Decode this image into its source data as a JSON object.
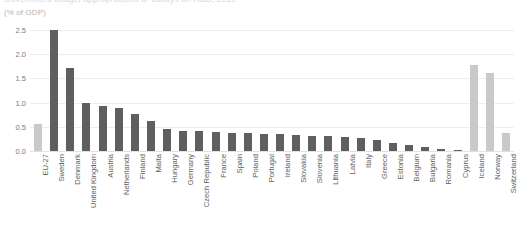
{
  "header": {
    "title": "Government budget appropriations or outlays on R&D, 2019",
    "subtitle": "(% of GDP)"
  },
  "axis": {
    "yticks": [
      "2.5",
      "2.0",
      "1.5",
      "1.0",
      "0.5",
      "0.0"
    ],
    "ymin": 0.0,
    "ymax": 2.5
  },
  "colors": {
    "bar_member": "#5f5f5f",
    "bar_other": "#c9c9c9",
    "gridline": "#ededed",
    "axis_text": "#6d6d6d",
    "background": "#ffffff"
  },
  "chart_data": {
    "type": "bar",
    "title": "Government budget appropriations or outlays on R&D, 2019",
    "subtitle": "(% of GDP)",
    "xlabel": "",
    "ylabel": "(% of GDP)",
    "ylim": [
      0.0,
      2.5
    ],
    "ytick_values": [
      0.0,
      0.5,
      1.0,
      1.5,
      2.0,
      2.5
    ],
    "grid": true,
    "legend": "none",
    "categories": [
      "EU-27",
      "Sweden",
      "Denmark",
      "United Kingdom",
      "Austria",
      "Netherlands",
      "Finland",
      "Malta",
      "Hungary",
      "Germany",
      "Czech Republic",
      "France",
      "Spain",
      "Poland",
      "Portugal",
      "Ireland",
      "Slovakia",
      "Slovenia",
      "Lithuania",
      "Latvia",
      "Italy",
      "Greece",
      "Estonia",
      "Belgium",
      "Bulgaria",
      "Romania",
      "Cyprus",
      "Iceland",
      "Norway",
      "Switzerland"
    ],
    "values": [
      0.55,
      2.5,
      1.72,
      1.0,
      0.93,
      0.88,
      0.76,
      0.62,
      0.45,
      0.42,
      0.41,
      0.39,
      0.38,
      0.37,
      0.36,
      0.35,
      0.33,
      0.32,
      0.3,
      0.28,
      0.26,
      0.22,
      0.16,
      0.12,
      0.08,
      0.05,
      0.03,
      1.78,
      1.62,
      0.38
    ],
    "series": [
      {
        "name": "% of GDP",
        "values": [
          0.55,
          2.5,
          1.72,
          1.0,
          0.93,
          0.88,
          0.76,
          0.62,
          0.45,
          0.42,
          0.41,
          0.39,
          0.38,
          0.37,
          0.36,
          0.35,
          0.33,
          0.32,
          0.3,
          0.28,
          0.26,
          0.22,
          0.16,
          0.12,
          0.08,
          0.05,
          0.03,
          1.78,
          1.62,
          0.38
        ]
      }
    ],
    "bar_styles": [
      "other",
      "member",
      "member",
      "member",
      "member",
      "member",
      "member",
      "member",
      "member",
      "member",
      "member",
      "member",
      "member",
      "member",
      "member",
      "member",
      "member",
      "member",
      "member",
      "member",
      "member",
      "member",
      "member",
      "member",
      "member",
      "member",
      "member",
      "other",
      "other",
      "other"
    ]
  }
}
